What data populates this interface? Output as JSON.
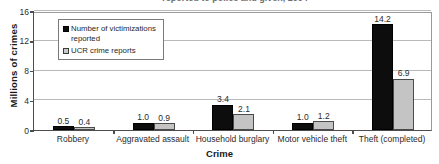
{
  "chart_data": {
    "type": "bar",
    "title": "reported to police and given, 2004",
    "xlabel": "Crime",
    "ylabel": "Millions of crimes",
    "categories": [
      "Robbery",
      "Aggravated assault",
      "Household burglary",
      "Motor vehicle theft",
      "Theft (completed)"
    ],
    "series": [
      {
        "name": "Number of victimizations reported",
        "values": [
          0.5,
          1.0,
          3.4,
          1.0,
          14.2
        ],
        "labels": [
          "0.5",
          "1.0",
          "3.4",
          "1.0",
          "14.2"
        ],
        "color": "#0d0d0d"
      },
      {
        "name": "UCR crime reports",
        "values": [
          0.4,
          0.9,
          2.1,
          1.2,
          6.9
        ],
        "labels": [
          "0.4",
          "0.9",
          "2.1",
          "1.2",
          "6.9"
        ],
        "color": "#c4c4c4"
      }
    ],
    "ylim": [
      0,
      16
    ],
    "yticks": [
      0,
      4,
      8,
      12,
      16
    ],
    "ytick_labels": [
      "0",
      "4",
      "8",
      "12",
      "16"
    ],
    "grid": true,
    "legend_position": "top-left"
  }
}
